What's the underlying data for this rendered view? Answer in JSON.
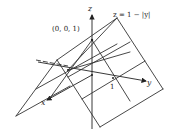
{
  "figure": {
    "labels": {
      "z_axis": "z",
      "y_axis": "y",
      "x_axis": "x",
      "apex": "(0, 0, 1)",
      "surface": "z = 1 − |y|",
      "y_tick": "1"
    },
    "colors": {
      "line": "#333333",
      "background": "#ffffff"
    }
  }
}
